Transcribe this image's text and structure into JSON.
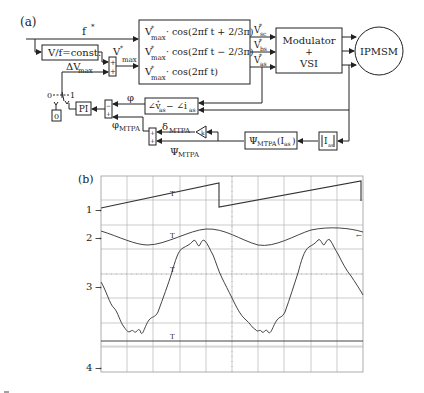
{
  "panel_a": {
    "label": "(a)",
    "f_ref": "f",
    "vf_block": "V/f=const.",
    "dv_label": "ΔV",
    "dv_sub": "max",
    "vmax_label": "V",
    "vmax_sub": "max",
    "cos_lines": [
      {
        "v": "V",
        "sub": "max",
        "expr": "· cos(2πf t + 2/3π)"
      },
      {
        "v": "V",
        "sub": "max",
        "expr": "· cos(2πf t − 2/3π)"
      },
      {
        "v": "V",
        "sub": "max",
        "expr": "· cos(2πf t)"
      }
    ],
    "outputs": [
      {
        "v": "V",
        "sub": "sc"
      },
      {
        "v": "V",
        "sub": "bs"
      },
      {
        "v": "V",
        "sub": "as"
      }
    ],
    "modulator": {
      "line1": "Modulator",
      "line2": "+",
      "line3": "VSI"
    },
    "motor": "IPMSM",
    "switch_0": "0",
    "switch_1": "1",
    "zero_block": "0",
    "pi_block": "PI",
    "phi": "φ",
    "phase_block": "∠v",
    "phase_sub1": "as",
    "phase_mid": " − ∠i",
    "phase_sub2": "as",
    "phi_mtpa": "φ",
    "phi_mtpa_sub": "MTPA",
    "delta_mtpa": "δ",
    "delta_mtpa_sub": "MTPA",
    "psi_mtpa": "Ψ",
    "psi_mtpa_sub": "MTPA",
    "psi_block": "Ψ",
    "psi_block_sub": "MTPA",
    "psi_block_arg": "(I",
    "psi_block_arg_sub": "as",
    "psi_block_close": ")",
    "gain": "k",
    "abs_block": "I",
    "abs_block_sub": "as",
    "plus": "+"
  },
  "panel_b": {
    "label": "(b)",
    "channels": [
      "1",
      "2",
      "3",
      "4"
    ],
    "trigger_marker": "T",
    "grid": {
      "cols": 10,
      "rows": 8
    }
  }
}
